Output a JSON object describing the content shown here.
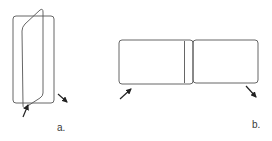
{
  "figure": {
    "panels": [
      {
        "id": "a",
        "label": "a.",
        "description": "Two rounded rectangular frames intersecting at an angle, with two arrows at the bottom"
      },
      {
        "id": "b",
        "label": "b.",
        "description": "Two rounded rectangular frames placed side by side, with arrows at the bottom-left and bottom-right corners"
      }
    ]
  },
  "colors": {
    "stroke": "#555555",
    "arrow": "#222222",
    "background": "#ffffff"
  }
}
